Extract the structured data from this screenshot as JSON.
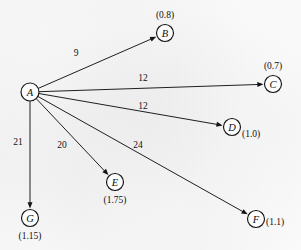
{
  "figure": {
    "type": "directed-graph",
    "background_color": "#fdfdfd",
    "ink_color": "#141414",
    "source_node": "A",
    "nodes": [
      {
        "id": "A",
        "label": "A",
        "value": "",
        "value_position": "none",
        "cx": 30,
        "cy": 92,
        "r": 9,
        "vx": 30,
        "vy": 92
      },
      {
        "id": "B",
        "label": "B",
        "value": "(0.8)",
        "value_position": "above",
        "cx": 165,
        "cy": 33,
        "r": 8.5,
        "vx": 165,
        "vy": 15
      },
      {
        "id": "C",
        "label": "C",
        "value": "(0.7)",
        "value_position": "above",
        "cx": 273,
        "cy": 84,
        "r": 8.5,
        "vx": 273,
        "vy": 66
      },
      {
        "id": "D",
        "label": "D",
        "value": "(1.0)",
        "value_position": "right",
        "cx": 232,
        "cy": 127,
        "r": 8.5,
        "vx": 242,
        "vy": 134
      },
      {
        "id": "E",
        "label": "E",
        "value": "(1.75)",
        "value_position": "below",
        "cx": 115,
        "cy": 182,
        "r": 8.5,
        "vx": 115,
        "vy": 200
      },
      {
        "id": "F",
        "label": "F",
        "value": "(1.1)",
        "value_position": "right",
        "cx": 256,
        "cy": 219,
        "r": 8.5,
        "vx": 266,
        "vy": 222
      },
      {
        "id": "G",
        "label": "G",
        "value": "(1.15)",
        "value_position": "below",
        "cx": 30,
        "cy": 218,
        "r": 8.5,
        "vx": 30,
        "vy": 236
      }
    ],
    "edges": [
      {
        "from": "A",
        "to": "B",
        "weight": "9",
        "lx": 76,
        "ly": 53
      },
      {
        "from": "A",
        "to": "C",
        "weight": "12",
        "lx": 143,
        "ly": 78
      },
      {
        "from": "A",
        "to": "D",
        "weight": "12",
        "lx": 143,
        "ly": 106
      },
      {
        "from": "A",
        "to": "E",
        "weight": "20",
        "lx": 62,
        "ly": 145
      },
      {
        "from": "A",
        "to": "F",
        "weight": "24",
        "lx": 138,
        "ly": 145
      },
      {
        "from": "A",
        "to": "G",
        "weight": "21",
        "lx": 18,
        "ly": 142
      }
    ]
  }
}
